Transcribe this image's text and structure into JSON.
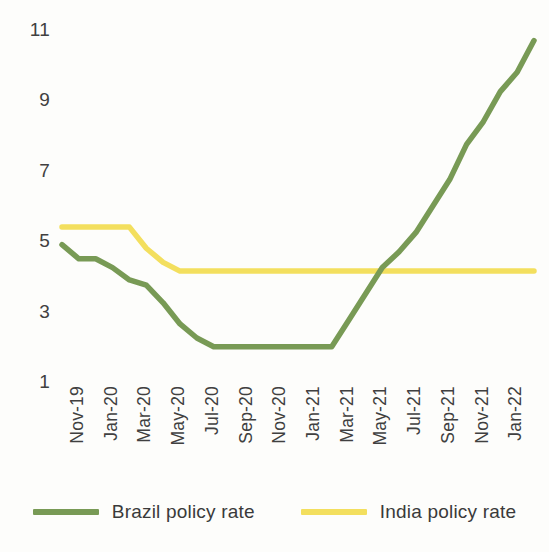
{
  "chart_data": {
    "type": "line",
    "title": "",
    "xlabel": "",
    "ylabel": "",
    "ylim": [
      1,
      11
    ],
    "yticks": [
      1,
      3,
      5,
      7,
      9,
      11
    ],
    "grid": false,
    "legend_position": "bottom",
    "x": [
      "Nov-19",
      "Dec-19",
      "Jan-20",
      "Feb-20",
      "Mar-20",
      "Apr-20",
      "May-20",
      "Jun-20",
      "Jul-20",
      "Aug-20",
      "Sep-20",
      "Oct-20",
      "Nov-20",
      "Dec-20",
      "Jan-21",
      "Feb-21",
      "Mar-21",
      "Apr-21",
      "May-21",
      "Jun-21",
      "Jul-21",
      "Aug-21",
      "Sep-21",
      "Oct-21",
      "Nov-21",
      "Dec-21",
      "Jan-22",
      "Feb-22",
      "Mar-22"
    ],
    "xtick_labels": [
      "Nov-19",
      "Jan-20",
      "Mar-20",
      "May-20",
      "Jul-20",
      "Sep-20",
      "Nov-20",
      "Jan-21",
      "Mar-21",
      "May-21",
      "Jul-21",
      "Sep-21",
      "Nov-21",
      "Jan-22"
    ],
    "series": [
      {
        "name": "Brazil policy rate",
        "color": "#789a55",
        "values": [
          4.9,
          4.5,
          4.5,
          4.25,
          3.9,
          3.75,
          3.25,
          2.65,
          2.25,
          2.0,
          2.0,
          2.0,
          2.0,
          2.0,
          2.0,
          2.0,
          2.0,
          2.75,
          3.5,
          4.25,
          4.7,
          5.25,
          6.0,
          6.75,
          7.75,
          8.4,
          9.25,
          9.8,
          10.7
        ]
      },
      {
        "name": "India policy rate",
        "color": "#f3df5e",
        "values": [
          5.4,
          5.4,
          5.4,
          5.4,
          5.4,
          4.8,
          4.4,
          4.15,
          4.15,
          4.15,
          4.15,
          4.15,
          4.15,
          4.15,
          4.15,
          4.15,
          4.15,
          4.15,
          4.15,
          4.15,
          4.15,
          4.15,
          4.15,
          4.15,
          4.15,
          4.15,
          4.15,
          4.15,
          4.15
        ]
      }
    ]
  },
  "legend": {
    "items": [
      {
        "label": "Brazil policy rate",
        "color": "#789a55"
      },
      {
        "label": "India policy rate",
        "color": "#f3df5e"
      }
    ]
  }
}
